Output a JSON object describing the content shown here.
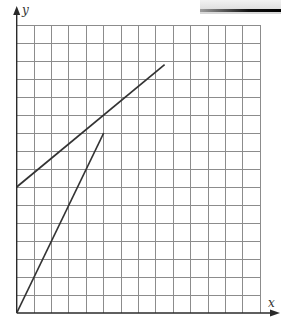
{
  "chart_data": {
    "type": "line",
    "title": "",
    "xlabel": "x",
    "ylabel": "y",
    "grid": true,
    "grid_columns": 14,
    "grid_rows": 16,
    "xlim": [
      0,
      14
    ],
    "ylim": [
      0,
      16
    ],
    "tick_labels": false,
    "legend": null,
    "series": [
      {
        "name": "line-a (steep, through origin)",
        "points": [
          [
            0,
            0
          ],
          [
            5,
            10
          ]
        ],
        "slope": 2,
        "intercept": 0
      },
      {
        "name": "line-b (shallow, y-intercept 7)",
        "points": [
          [
            0,
            7
          ],
          [
            8.5,
            13.8
          ]
        ],
        "slope": 0.8,
        "intercept": 7
      }
    ]
  },
  "axes": {
    "x_label": "x",
    "y_label": "y"
  },
  "style": {
    "grid_color": "#8c8c8c",
    "line_color": "#333333",
    "background": "#ffffff"
  }
}
